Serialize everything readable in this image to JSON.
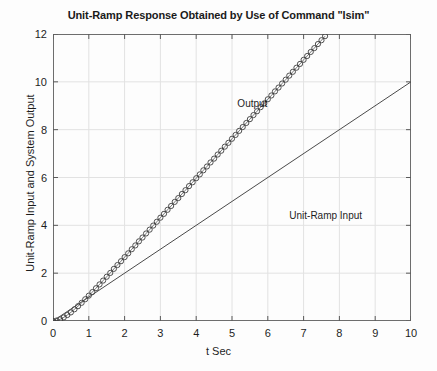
{
  "chart_data": {
    "type": "line",
    "title": "Unit-Ramp Response Obtained by Use of Command \"lsim\"",
    "xlabel": "t Sec",
    "ylabel": "Unit-Ramp Input and System Output",
    "xlim": [
      0,
      10
    ],
    "ylim": [
      0,
      12
    ],
    "xticks": [
      "0",
      "1",
      "2",
      "3",
      "4",
      "5",
      "6",
      "7",
      "8",
      "9",
      "10"
    ],
    "yticks": [
      "0",
      "2",
      "4",
      "6",
      "8",
      "10",
      "12"
    ],
    "grid": true,
    "legend_position": "inline-annotations",
    "annotations": [
      {
        "text": "Output",
        "x": 5.15,
        "y": 9.05
      },
      {
        "text": "Unit-Ramp Input",
        "x": 6.6,
        "y": 4.35
      }
    ],
    "series": [
      {
        "name": "Output",
        "style": "markers-circles",
        "marker": "o",
        "color": "#3c3c3c",
        "x": [
          0,
          0.1,
          0.2,
          0.3,
          0.4,
          0.5,
          0.6,
          0.7,
          0.8,
          0.9,
          1.0,
          1.1,
          1.2,
          1.3,
          1.4,
          1.5,
          1.6,
          1.7,
          1.8,
          1.9,
          2.0,
          2.1,
          2.2,
          2.3,
          2.4,
          2.5,
          2.6,
          2.7,
          2.8,
          2.9,
          3.0,
          3.1,
          3.2,
          3.3,
          3.4,
          3.5,
          3.6,
          3.7,
          3.8,
          3.9,
          4.0,
          4.1,
          4.2,
          4.3,
          4.4,
          4.5,
          4.6,
          4.7,
          4.8,
          4.9,
          5.0,
          5.1,
          5.2,
          5.3,
          5.4,
          5.5,
          5.6,
          5.7,
          5.8,
          5.9,
          6.0,
          6.1,
          6.2,
          6.3,
          6.4,
          6.5,
          6.6,
          6.7,
          6.8,
          6.9,
          7.0,
          7.1,
          7.2,
          7.3,
          7.4,
          7.5,
          7.6,
          7.7,
          7.8,
          7.9,
          8.0,
          8.1,
          8.2,
          8.3,
          8.4,
          8.5,
          8.6,
          8.7,
          8.8,
          8.9,
          9.0,
          9.1,
          9.2,
          9.3,
          9.4,
          9.5,
          9.6,
          9.7,
          9.8,
          9.9,
          10.0
        ],
        "y": [
          0,
          0.02,
          0.07,
          0.15,
          0.25,
          0.36,
          0.49,
          0.62,
          0.76,
          0.91,
          1.06,
          1.21,
          1.37,
          1.53,
          1.69,
          1.85,
          2.01,
          2.18,
          2.34,
          2.5,
          2.67,
          2.83,
          3.0,
          3.16,
          3.33,
          3.49,
          3.66,
          3.82,
          3.99,
          4.15,
          4.32,
          4.48,
          4.65,
          4.81,
          4.98,
          5.14,
          5.31,
          5.47,
          5.64,
          5.8,
          5.97,
          6.13,
          6.3,
          6.46,
          6.63,
          6.79,
          6.96,
          7.12,
          7.29,
          7.45,
          7.62,
          7.78,
          7.95,
          8.11,
          8.28,
          8.44,
          8.61,
          8.77,
          8.94,
          9.1,
          9.27,
          9.43,
          9.6,
          9.76,
          9.93,
          10.09,
          10.26,
          10.42,
          10.59,
          10.75,
          10.92,
          11.08,
          11.25,
          11.41,
          11.58,
          11.74,
          11.91,
          12.07,
          12.24,
          12.4,
          12.57,
          12.73,
          12.9,
          13.06,
          13.23,
          13.39,
          13.56,
          13.72,
          13.89,
          14.05,
          14.22,
          14.38,
          14.55,
          14.71,
          14.88,
          15.04,
          15.21,
          15.37,
          15.54,
          15.7,
          15.87
        ]
      },
      {
        "name": "Unit-Ramp Input",
        "style": "line",
        "color": "#4a4a4a",
        "x": [
          0,
          10
        ],
        "y": [
          0,
          10
        ]
      }
    ]
  }
}
